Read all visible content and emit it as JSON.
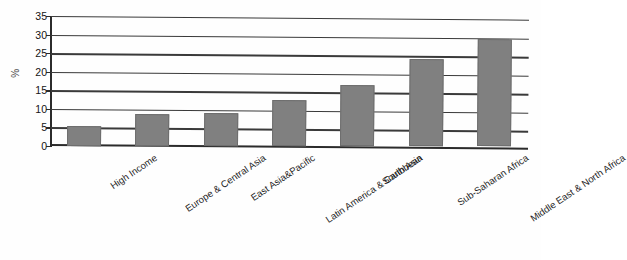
{
  "chart_data": {
    "type": "bar",
    "title": "",
    "subtitle": "",
    "xlabel": "",
    "ylabel": "%",
    "categories": [
      "High Income",
      "Europe & Central Asia",
      "East Asia&Pacific",
      "Latin America & Caribbean",
      "South Asia",
      "Sub-Saharan Africa",
      "Middle East & North Africa"
    ],
    "values": [
      5.3,
      8.6,
      8.9,
      12.3,
      16.3,
      23.4,
      28.8
    ],
    "ylim": [
      0,
      35
    ],
    "ytick_labels": [
      "0",
      "5",
      "10",
      "15",
      "20",
      "25",
      "30",
      "35"
    ],
    "ytick_values": [
      0,
      5,
      10,
      15,
      20,
      25,
      30,
      35
    ],
    "grid": true,
    "grid_axis": "y",
    "legend": false,
    "legend_position": "none",
    "bar_color": "#808080",
    "bar_edge_color": "#6d6d6d",
    "grid_color": "#3a3a3a",
    "axis_color": "#2b2b2b",
    "background_color": "#fefefe",
    "xtick_label_rotation": -34,
    "series": [
      {
        "name": "",
        "values": [
          5.3,
          8.6,
          8.9,
          12.3,
          16.3,
          23.4,
          28.8
        ]
      }
    ]
  },
  "caption": {
    "text": ""
  }
}
